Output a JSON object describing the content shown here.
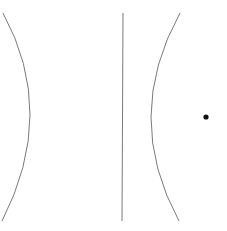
{
  "diagram": {
    "type": "conic-section",
    "stroke_color": "#7a7a7a",
    "point_color": "#111111",
    "elements": {
      "left_branch": {
        "top": [
          3,
          13
        ],
        "vertex": [
          30,
          115
        ],
        "bottom": [
          2,
          221
        ]
      },
      "right_branch": {
        "top": [
          180,
          13
        ],
        "vertex": [
          151,
          117
        ],
        "bottom": [
          179,
          221
        ]
      },
      "directrix": {
        "top": [
          123,
          13
        ],
        "bottom": [
          122,
          221
        ]
      },
      "focus": {
        "center": [
          206,
          117
        ],
        "radius": 2.6
      }
    }
  }
}
